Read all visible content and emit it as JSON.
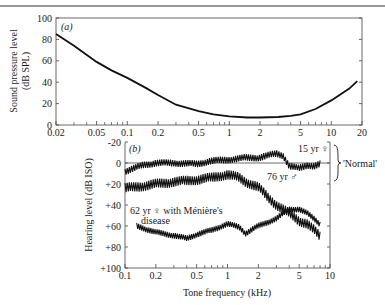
{
  "chart_data": [
    {
      "panel": "(a)",
      "type": "line",
      "title": "",
      "xlabel": "",
      "ylabel": "Sound pressure level (dB SPL)",
      "xscale": "log",
      "xlim": [
        0.02,
        20
      ],
      "ylim": [
        0,
        100
      ],
      "xticks": [
        "0.02",
        "0.05",
        "0.1",
        "0.2",
        "0.5",
        "1",
        "2",
        "5",
        "10",
        "20"
      ],
      "yticks": [
        "0",
        "20",
        "40",
        "60",
        "80",
        "100"
      ],
      "series": [
        {
          "name": "Threshold of hearing",
          "x": [
            0.02,
            0.03,
            0.05,
            0.07,
            0.1,
            0.15,
            0.2,
            0.3,
            0.5,
            0.7,
            1,
            1.5,
            2,
            3,
            4,
            5,
            7,
            10,
            15,
            18
          ],
          "y": [
            85,
            74,
            59,
            51,
            44,
            35,
            28,
            19,
            13,
            10,
            8,
            7,
            7,
            7.5,
            8.5,
            10,
            15,
            23,
            34,
            41
          ]
        }
      ]
    },
    {
      "panel": "(b)",
      "type": "line",
      "title": "",
      "xlabel": "Tone frequency (kHz)",
      "ylabel": "Hearing level (dB ISO)",
      "xscale": "log",
      "xlim": [
        0.1,
        10
      ],
      "ylim": [
        -20,
        100
      ],
      "y_inverted": true,
      "xticks": [
        "0.1",
        "0.2",
        "0.5",
        "1",
        "2",
        "5",
        "10"
      ],
      "yticks": [
        "-20",
        "0",
        "+20",
        "+40",
        "+60",
        "+80",
        "+100"
      ],
      "annotations": [
        "15 yr ♀",
        "76 yr ♂",
        "62 yr ♀ with Ménière's disease",
        "'Normal'"
      ],
      "series": [
        {
          "name": "15 yr ♀",
          "x": [
            0.1,
            0.15,
            0.2,
            0.3,
            0.5,
            0.7,
            1,
            1.5,
            2,
            3,
            3.5,
            4,
            5,
            6,
            7,
            8
          ],
          "y": [
            8,
            2,
            0,
            0,
            1,
            -2,
            -3,
            -5,
            -5,
            -9,
            -7,
            3,
            5,
            2,
            3,
            1
          ]
        },
        {
          "name": "76 yr ♂",
          "x": [
            0.1,
            0.15,
            0.2,
            0.3,
            0.5,
            0.7,
            1,
            1.3,
            1.5,
            2,
            2.5,
            3,
            4,
            5,
            6,
            7,
            8
          ],
          "y": [
            24,
            22,
            20,
            18,
            16,
            14,
            11,
            14,
            18,
            23,
            33,
            40,
            48,
            55,
            58,
            64,
            70
          ]
        },
        {
          "name": "62 yr ♀ with Ménière's disease",
          "x": [
            0.13,
            0.2,
            0.3,
            0.4,
            0.5,
            0.7,
            1,
            1.3,
            1.5,
            2,
            3,
            4,
            5,
            6,
            7,
            8
          ],
          "y": [
            60,
            66,
            69,
            72,
            68,
            64,
            58,
            61,
            67,
            60,
            53,
            44,
            44,
            48,
            53,
            58
          ]
        }
      ]
    }
  ],
  "panels": {
    "a": {
      "label": "(a)",
      "ylabel_line1": "Sound pressure level",
      "ylabel_line2": "(dB SPL)"
    },
    "b": {
      "label": "(b)",
      "ylabel": "Hearing level (dB ISO)",
      "xlabel": "Tone frequency (kHz)",
      "ann_15": "15 yr ♀",
      "ann_76": "76 yr ♂",
      "ann_62_line1": "62 yr ♀ with Ménière's",
      "ann_62_line2": "disease",
      "ann_normal": "'Normal'"
    }
  }
}
